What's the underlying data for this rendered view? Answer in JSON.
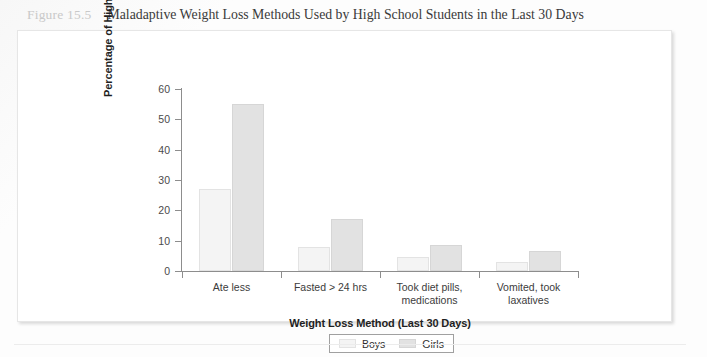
{
  "figure": {
    "number_label": "Figure 15.5",
    "title": "Maladaptive Weight Loss Methods Used by High School Students in the Last 30 Days"
  },
  "chart_data": {
    "type": "bar",
    "title": "Maladaptive Weight Loss Methods Used by High School Students in the Last 30 Days",
    "xlabel": "Weight Loss Method (Last 30 Days)",
    "ylabel": "Percentage of High School Students",
    "categories": [
      "Ate less",
      "Fasted > 24 hrs",
      "Took diet pills, medications",
      "Vomited, took laxatives"
    ],
    "category_lines": [
      [
        "Ate less"
      ],
      [
        "Fasted > 24 hrs"
      ],
      [
        "Took diet pills,",
        "medications"
      ],
      [
        "Vomited, took",
        "laxatives"
      ]
    ],
    "series": [
      {
        "name": "Boys",
        "color": "#f4f4f4",
        "values": [
          27,
          8,
          4.5,
          3
        ]
      },
      {
        "name": "Girls",
        "color": "#e2e2e2",
        "values": [
          55,
          17,
          8.5,
          6.5
        ]
      }
    ],
    "ylim": [
      0,
      60
    ],
    "ytick_step": 10,
    "ytick_labels": [
      "60",
      "50",
      "40",
      "30",
      "20",
      "10",
      "0"
    ],
    "ytick_values": [
      60,
      50,
      40,
      30,
      20,
      10,
      0
    ],
    "grid": false,
    "legend_position": "bottom-center",
    "legend_entries": [
      "Boys",
      "Girls"
    ]
  }
}
